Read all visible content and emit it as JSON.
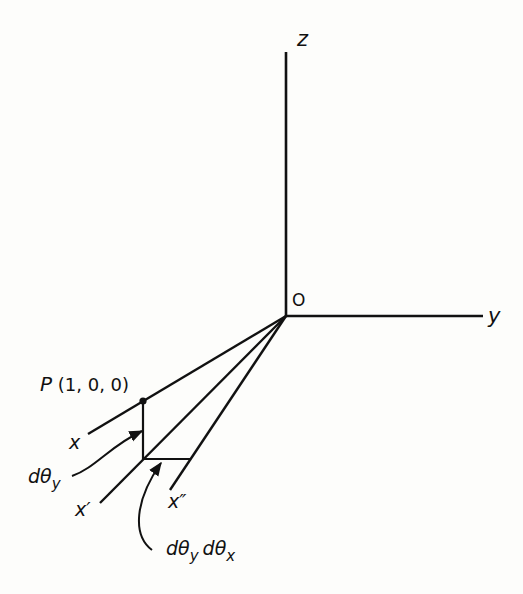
{
  "diagram": {
    "axes": {
      "z_label": "z",
      "y_label": "y",
      "origin_label": "O"
    },
    "point": {
      "label": "P(1, 0, 0)"
    },
    "lines": {
      "x_label": "x",
      "x_prime_label": "x′",
      "x_double_prime_label": "x″"
    },
    "annotations": {
      "dtheta_y": "dθ",
      "dtheta_y_sub": "y",
      "dtheta_yx_a": "dθ",
      "dtheta_yx_a_sub": "y",
      "dtheta_yx_b": "dθ",
      "dtheta_yx_b_sub": "x"
    },
    "colors": {
      "ink": "#111111",
      "paper": "#fdfdfb"
    }
  }
}
